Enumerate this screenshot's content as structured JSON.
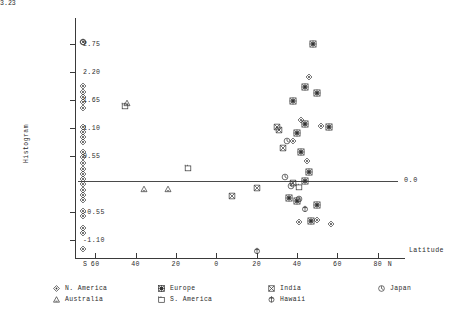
{
  "chart_data": {
    "type": "scatter",
    "title": "",
    "xlabel": "Latitude",
    "ylabel": "Histogram",
    "y_top_label": "3.23",
    "zero_line_label": "0.0",
    "xlim": [
      -70,
      90
    ],
    "ylim": [
      -1.45,
      3.23
    ],
    "grid": false,
    "legend_position": "below-axis",
    "x_ticks": [
      {
        "value": -60,
        "label": "60"
      },
      {
        "value": -40,
        "label": "40"
      },
      {
        "value": -20,
        "label": "20"
      },
      {
        "value": 0,
        "label": "0"
      },
      {
        "value": 20,
        "label": "20"
      },
      {
        "value": 40,
        "label": "40"
      },
      {
        "value": 60,
        "label": "60"
      },
      {
        "value": 80,
        "label": "80"
      }
    ],
    "x_axis_end_labels": {
      "left": "S",
      "right": "N"
    },
    "y_ticks": [
      {
        "value": 2.75,
        "label": "2.75"
      },
      {
        "value": 2.2,
        "label": "2.20"
      },
      {
        "value": 1.65,
        "label": "1.65"
      },
      {
        "value": 1.1,
        "label": "1.10"
      },
      {
        "value": 0.55,
        "label": "0.55"
      },
      {
        "value": -0.55,
        "label": "-0.55"
      },
      {
        "value": -1.1,
        "label": "-1.10"
      }
    ],
    "series": [
      {
        "name": "N. America",
        "marker": "diamond-dot",
        "points": [
          [
            -66,
            2.78
          ],
          [
            -66,
            1.92
          ],
          [
            -66,
            1.8
          ],
          [
            -66,
            1.7
          ],
          [
            -66,
            1.6
          ],
          [
            -66,
            1.48
          ],
          [
            -66,
            1.12
          ],
          [
            -66,
            1.02
          ],
          [
            -66,
            0.92
          ],
          [
            -66,
            0.82
          ],
          [
            -66,
            0.62
          ],
          [
            -66,
            0.52
          ],
          [
            -66,
            0.42
          ],
          [
            -66,
            0.3
          ],
          [
            -66,
            0.2
          ],
          [
            -66,
            0.1
          ],
          [
            -66,
            0.0
          ],
          [
            -66,
            -0.12
          ],
          [
            -66,
            -0.22
          ],
          [
            -66,
            -0.32
          ],
          [
            -66,
            -0.52
          ],
          [
            -66,
            -0.62
          ],
          [
            -66,
            -0.86
          ],
          [
            -66,
            -0.96
          ],
          [
            -66,
            -1.28
          ],
          [
            42,
            1.26
          ],
          [
            38,
            0.84
          ],
          [
            45,
            0.44
          ],
          [
            41,
            -0.74
          ],
          [
            50,
            -0.7
          ],
          [
            57,
            -0.78
          ],
          [
            46,
            2.1
          ],
          [
            52,
            1.14
          ]
        ]
      },
      {
        "name": "Europe",
        "marker": "star-box",
        "points": [
          [
            48,
            2.74
          ],
          [
            44,
            1.9
          ],
          [
            50,
            1.78
          ],
          [
            38,
            1.62
          ],
          [
            44,
            1.18
          ],
          [
            40,
            1.0
          ],
          [
            42,
            0.62
          ],
          [
            46,
            0.24
          ],
          [
            44,
            0.06
          ],
          [
            36,
            -0.28
          ],
          [
            40,
            -0.34
          ],
          [
            50,
            -0.42
          ],
          [
            47,
            -0.72
          ],
          [
            56,
            1.12
          ]
        ]
      },
      {
        "name": "India",
        "marker": "bowtie",
        "points": [
          [
            20,
            -0.08
          ],
          [
            33,
            0.7
          ],
          [
            30,
            1.12
          ],
          [
            31,
            1.06
          ],
          [
            8,
            -0.24
          ],
          [
            38,
            0.02
          ]
        ]
      },
      {
        "name": "Japan",
        "marker": "circle-dot",
        "points": [
          [
            -66,
            2.78
          ],
          [
            35,
            0.84
          ],
          [
            34,
            0.14
          ],
          [
            37,
            -0.04
          ],
          [
            41,
            -0.3
          ]
        ]
      },
      {
        "name": "Australia",
        "marker": "triangle",
        "points": [
          [
            -44,
            1.58
          ],
          [
            -36,
            -0.1
          ],
          [
            -24,
            -0.1
          ]
        ]
      },
      {
        "name": "S. America",
        "marker": "square-tab",
        "points": [
          [
            -45,
            1.52
          ],
          [
            -14,
            0.32
          ],
          [
            41,
            -0.06
          ]
        ]
      },
      {
        "name": "Hawaii",
        "marker": "circle-cross",
        "points": [
          [
            20,
            -1.32
          ],
          [
            44,
            -0.5
          ]
        ]
      }
    ]
  },
  "legend": {
    "entries": [
      {
        "label": "N. America",
        "marker": "diamond-dot"
      },
      {
        "label": "Europe",
        "marker": "star-box"
      },
      {
        "label": "India",
        "marker": "bowtie"
      },
      {
        "label": "Japan",
        "marker": "circle-dot"
      },
      {
        "label": "Australia",
        "marker": "triangle"
      },
      {
        "label": "S. America",
        "marker": "square-tab"
      },
      {
        "label": "Hawaii",
        "marker": "circle-cross"
      }
    ]
  },
  "colors": {
    "axis": "#3a3a3a",
    "marker": "#333333",
    "text": "#2b2b2b",
    "background": "#ffffff"
  }
}
